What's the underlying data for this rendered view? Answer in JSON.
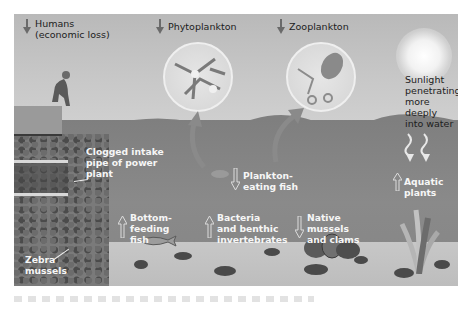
{
  "diagram": {
    "type": "ecosystem-impact-illustration",
    "palette": {
      "sky": "#c4c4c4",
      "water": "#838383",
      "lakebed": "#c2c2c2",
      "label_dark": "#1c1c1c",
      "label_light": "#f6f6f6",
      "arrow_fill": "#6a6a6a"
    },
    "effects": [
      {
        "id": "humans",
        "label": "Humans\n(economic loss)",
        "direction": "decrease",
        "arrow": "down"
      },
      {
        "id": "phytoplankton",
        "label": "Phytoplankton",
        "direction": "decrease",
        "arrow": "down"
      },
      {
        "id": "zooplankton",
        "label": "Zooplankton",
        "direction": "decrease",
        "arrow": "down"
      },
      {
        "id": "plankton-eating-fish",
        "label": "Plankton-\neating fish",
        "direction": "decrease",
        "arrow": "down"
      },
      {
        "id": "bottom-feeding-fish",
        "label": "Bottom-\nfeeding\nfish",
        "direction": "increase",
        "arrow": "up"
      },
      {
        "id": "bacteria-benthic",
        "label": "Bacteria\nand benthic\ninvertebrates",
        "direction": "increase",
        "arrow": "up"
      },
      {
        "id": "native-mussels",
        "label": "Native\nmussels\nand clams",
        "direction": "decrease",
        "arrow": "down"
      },
      {
        "id": "aquatic-plants",
        "label": "Aquatic plants",
        "direction": "increase",
        "arrow": "up"
      }
    ],
    "annotations": [
      {
        "id": "intake-pipe",
        "label": "Clogged intake\npipe of power\nplant"
      },
      {
        "id": "zebra-mussels",
        "label": "Zebra\nmussels"
      },
      {
        "id": "sunlight",
        "label": "Sunlight\npenetrating\nmore deeply\ninto water"
      }
    ]
  }
}
